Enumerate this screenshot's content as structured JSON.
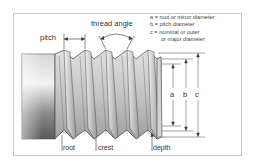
{
  "diagram": {
    "labels": {
      "pitch": "pitch",
      "thread_angle": "thread angle",
      "root": "root",
      "crest": "crest",
      "depth": "depth",
      "a": "a",
      "b": "b",
      "c": "c"
    },
    "legend": [
      {
        "key": "a",
        "text": "a = root or minor diameter"
      },
      {
        "key": "b",
        "text": "b = pitch diameter"
      },
      {
        "key": "c",
        "text": "c = nominal or outer"
      },
      {
        "key": "c_cont",
        "text": "or major diameter"
      }
    ],
    "colors": {
      "border": "#c8c8c8",
      "line": "#333333",
      "metal_light": "#e6e6e6",
      "metal_dark": "#707070"
    }
  }
}
